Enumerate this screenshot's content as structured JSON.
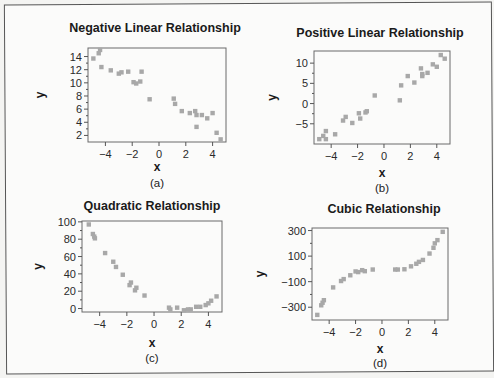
{
  "chart_data": [
    {
      "type": "scatter",
      "title": "Negative Linear Relationship",
      "panel_label": "(a)",
      "xlabel": "x",
      "ylabel": "y",
      "xlim": [
        -5.3,
        5.0
      ],
      "ylim": [
        1.0,
        15.3
      ],
      "xticks": [
        -4,
        -2,
        0,
        2,
        4
      ],
      "xtick_labels": [
        "−4",
        "−2",
        "0",
        "2",
        "4"
      ],
      "yticks": [
        2,
        4,
        6,
        8,
        10,
        12,
        14
      ],
      "ytick_labels": [
        "2",
        "4",
        "6",
        "8",
        "10",
        "12",
        "14"
      ],
      "x": [
        -4.9,
        -4.5,
        -4.4,
        -4.3,
        -3.6,
        -3.0,
        -2.8,
        -2.3,
        -1.9,
        -1.7,
        -1.4,
        -1.3,
        -0.7,
        1.1,
        1.2,
        1.7,
        2.3,
        2.7,
        2.8,
        2.8,
        3.2,
        3.6,
        4.0,
        4.3,
        4.6
      ],
      "y": [
        13.7,
        14.5,
        15.0,
        12.4,
        11.9,
        11.4,
        11.6,
        11.7,
        10.1,
        9.9,
        10.2,
        11.7,
        7.5,
        7.6,
        6.8,
        5.7,
        5.4,
        5.7,
        5.1,
        3.3,
        5.1,
        4.6,
        5.4,
        2.4,
        1.4
      ]
    },
    {
      "type": "scatter",
      "title": "Positive Linear Relationship",
      "panel_label": "(b)",
      "xlabel": "x",
      "ylabel": "y",
      "xlim": [
        -5.3,
        5.0
      ],
      "ylim": [
        -10.0,
        13.0
      ],
      "xticks": [
        -4,
        -2,
        0,
        2,
        4
      ],
      "xtick_labels": [
        "−4",
        "−2",
        "0",
        "2",
        "4"
      ],
      "yticks": [
        -5,
        0,
        5,
        10
      ],
      "ytick_labels": [
        "−5",
        "0",
        "5",
        "10"
      ],
      "x": [
        -4.9,
        -4.6,
        -4.4,
        -4.4,
        -3.7,
        -3.1,
        -2.9,
        -2.4,
        -1.9,
        -1.8,
        -1.4,
        -1.3,
        -0.7,
        1.2,
        1.3,
        1.8,
        2.3,
        2.8,
        2.9,
        2.9,
        3.3,
        3.7,
        4.0,
        4.3,
        4.6
      ],
      "y": [
        -8.8,
        -8.0,
        -8.8,
        -6.8,
        -7.6,
        -4.2,
        -3.3,
        -4.8,
        -2.4,
        -3.7,
        -2.2,
        -1.9,
        2.0,
        0.8,
        4.5,
        6.8,
        5.2,
        8.7,
        6.8,
        7.3,
        7.6,
        9.7,
        9.1,
        12.0,
        11.1
      ]
    },
    {
      "type": "scatter",
      "title": "Quadratic Relationship",
      "panel_label": "(c)",
      "xlabel": "x",
      "ylabel": "y",
      "xlim": [
        -5.3,
        5.0
      ],
      "ylim": [
        -4.0,
        101.0
      ],
      "xticks": [
        -4,
        -2,
        0,
        2,
        4
      ],
      "xtick_labels": [
        "−4",
        "−2",
        "0",
        "2",
        "4"
      ],
      "yticks": [
        0,
        20,
        40,
        60,
        80,
        100
      ],
      "ytick_labels": [
        "0",
        "20",
        "40",
        "60",
        "80",
        "100"
      ],
      "x": [
        -4.8,
        -4.5,
        -4.4,
        -4.35,
        -3.6,
        -3.0,
        -2.8,
        -2.3,
        -1.8,
        -1.7,
        -1.4,
        -1.3,
        -0.7,
        1.1,
        1.2,
        1.7,
        2.2,
        2.5,
        2.7,
        3.1,
        3.4,
        3.8,
        4.0,
        4.2,
        4.6
      ],
      "y": [
        97,
        86,
        83,
        81,
        64,
        54,
        48,
        39,
        27,
        30,
        21,
        24,
        15,
        1,
        -1,
        1,
        -2,
        -1,
        -1,
        2,
        2,
        4,
        6,
        9,
        14
      ]
    },
    {
      "type": "scatter",
      "title": "Cubic Relationship",
      "panel_label": "(d)",
      "xlabel": "x",
      "ylabel": "y",
      "xlim": [
        -5.3,
        5.0
      ],
      "ylim": [
        -400,
        320
      ],
      "xticks": [
        -4,
        -2,
        0,
        2,
        4
      ],
      "xtick_labels": [
        "−4",
        "−2",
        "0",
        "2",
        "4"
      ],
      "yticks": [
        -300,
        -100,
        100,
        300
      ],
      "ytick_labels": [
        "−300",
        "−100",
        "100",
        "300"
      ],
      "x": [
        -4.9,
        -4.6,
        -4.5,
        -4.4,
        -3.7,
        -3.1,
        -2.9,
        -2.4,
        -2.0,
        -1.8,
        -1.5,
        -1.3,
        -0.7,
        1.0,
        1.2,
        1.7,
        2.2,
        2.6,
        2.8,
        3.1,
        3.6,
        3.9,
        4.0,
        4.2,
        4.6
      ],
      "y": [
        -360,
        -285,
        -265,
        -245,
        -145,
        -95,
        -80,
        -50,
        -20,
        -25,
        -10,
        -18,
        -5,
        -5,
        -5,
        -3,
        20,
        40,
        55,
        70,
        120,
        165,
        200,
        225,
        290
      ]
    }
  ]
}
